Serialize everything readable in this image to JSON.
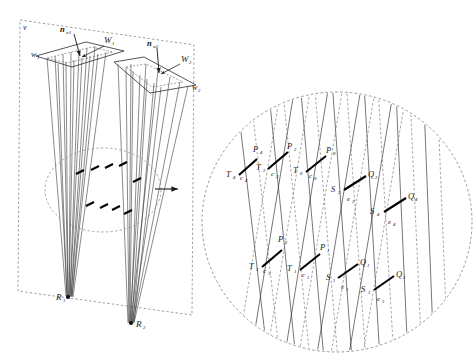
{
  "figure": {
    "background_color": "#ffffff",
    "line_color": "#2b2b2b",
    "dashed_color": "#6b6b6b",
    "bold_segment_color": "#000000",
    "panels": [
      {
        "id": "overview",
        "name": "overview-panel",
        "shape": "dashed-parallelogram"
      },
      {
        "id": "detail",
        "name": "detail-panel",
        "shape": "dashed-ellipse"
      }
    ]
  },
  "overview": {
    "frame_label": "v",
    "planes": [
      {
        "id": "w1",
        "plane_label": "W",
        "plane_sub": "1",
        "patch_label": "w",
        "patch_sub": "1",
        "normal_label": "n",
        "normal_sub": "w1"
      },
      {
        "id": "w2",
        "plane_label": "W",
        "plane_sub": "2",
        "patch_label": "w",
        "patch_sub": "2",
        "normal_label": "n",
        "normal_sub": "w2"
      }
    ],
    "convergence_points": [
      {
        "label": "R",
        "sub": "1"
      },
      {
        "label": "R",
        "sub": "2"
      }
    ],
    "magnify_arrow": "magnify-arrow",
    "detail_region": "dashed-ellipse-region"
  },
  "detail": {
    "segments_c": [
      {
        "start_label": "T",
        "start_sub": "4",
        "seg_label": "c",
        "seg_sub": "4",
        "end_label": "P",
        "end_sub": "4"
      },
      {
        "start_label": "T",
        "start_sub": "2",
        "seg_label": "c",
        "seg_sub": "2",
        "end_label": "P",
        "end_sub": "2"
      },
      {
        "start_label": "T",
        "start_sub": "0",
        "seg_label": "c",
        "seg_sub": "0",
        "end_label": "P",
        "end_sub": "0"
      },
      {
        "start_label": "T",
        "start_sub": "3",
        "seg_label": "c",
        "seg_sub": "3",
        "end_label": "P",
        "end_sub": "3"
      },
      {
        "start_label": "T",
        "start_sub": "1",
        "seg_label": "c",
        "seg_sub": "1",
        "end_label": "P",
        "end_sub": "1"
      }
    ],
    "segments_e": [
      {
        "start_label": "S",
        "start_sub": "2",
        "seg_label": "e",
        "seg_sub": "2",
        "end_label": "Q",
        "end_sub": "2"
      },
      {
        "start_label": "S",
        "start_sub": "4",
        "seg_label": "e",
        "seg_sub": "4",
        "end_label": "Q",
        "end_sub": "4"
      },
      {
        "start_label": "S",
        "start_sub": "1",
        "seg_label": "e",
        "seg_sub": "1",
        "end_label": "Q",
        "end_sub": "1"
      },
      {
        "start_label": "S",
        "start_sub": "3",
        "seg_label": "e",
        "seg_sub": "3",
        "end_label": "Q",
        "end_sub": "3"
      }
    ]
  }
}
